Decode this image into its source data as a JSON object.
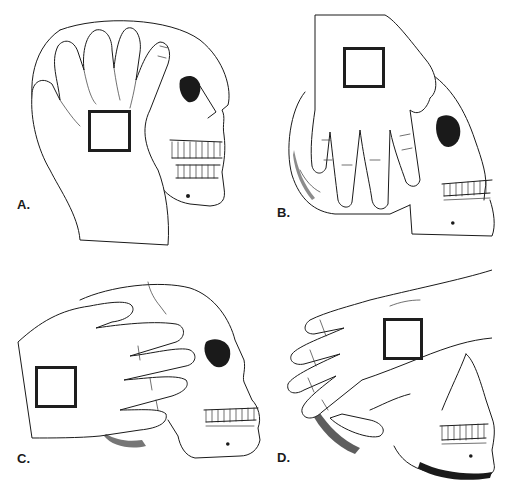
{
  "figure": {
    "panels": [
      {
        "id": "A",
        "label": "A.",
        "view": "hand cupping top and back of skull, fingers over cranium",
        "marker": "square box on back of hand"
      },
      {
        "id": "B",
        "label": "B.",
        "view": "hand spread over cranium from above, fingers pointing down toward face",
        "marker": "square box on back of hand"
      },
      {
        "id": "C",
        "label": "C.",
        "view": "hand across side of head, fingers extending toward orbit",
        "marker": "square box on back of hand"
      },
      {
        "id": "D",
        "label": "D.",
        "view": "hand cradling back of skull from behind, fingers wrapped around occiput",
        "marker": "square box on back of hand"
      }
    ],
    "colors": {
      "line": "#1a1a1a",
      "background": "#ffffff",
      "marker_border": "#1e1e1e"
    }
  }
}
